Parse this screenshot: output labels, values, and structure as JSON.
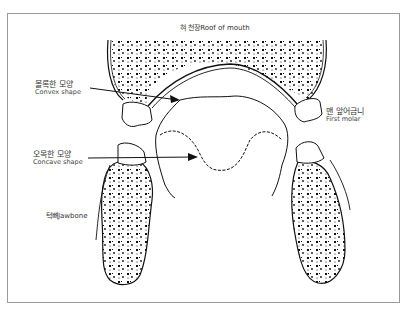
{
  "diagram": {
    "labels": {
      "roof_of_mouth": "혀 천장Roof of mouth",
      "convex_ko": "볼록한 모양",
      "convex_en": "Convex shape",
      "first_molar_ko": "맨 앞어금니",
      "first_molar_en": "First molar",
      "concave_ko": "오목한 모양",
      "concave_en": "Concave shape",
      "jawbone": "턱뼈Jawbone"
    },
    "colors": {
      "ink": "#111111",
      "frame": "#9a9a9a",
      "text": "#333333"
    }
  }
}
